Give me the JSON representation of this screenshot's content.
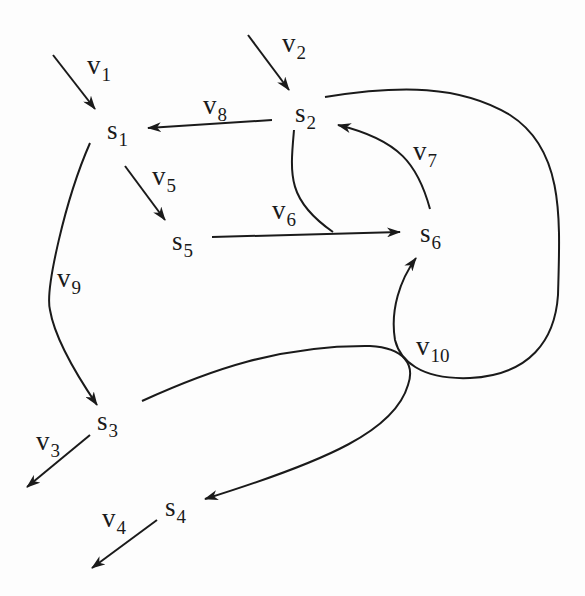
{
  "diagram": {
    "type": "directed-graph",
    "nodes": [
      {
        "id": "s1",
        "text": "s",
        "sub": "1"
      },
      {
        "id": "s2",
        "text": "s",
        "sub": "2"
      },
      {
        "id": "s3",
        "text": "s",
        "sub": "3"
      },
      {
        "id": "s4",
        "text": "s",
        "sub": "4"
      },
      {
        "id": "s5",
        "text": "s",
        "sub": "5"
      },
      {
        "id": "s6",
        "text": "s",
        "sub": "6"
      }
    ],
    "edges": [
      {
        "id": "v1",
        "text": "v",
        "sub": "1",
        "from": "input",
        "to": "s1"
      },
      {
        "id": "v2",
        "text": "v",
        "sub": "2",
        "from": "input",
        "to": "s2"
      },
      {
        "id": "v3",
        "text": "v",
        "sub": "3",
        "from": "s3",
        "to": "output"
      },
      {
        "id": "v4",
        "text": "v",
        "sub": "4",
        "from": "s4",
        "to": "output"
      },
      {
        "id": "v5",
        "text": "v",
        "sub": "5",
        "from": "s1",
        "to": "s5"
      },
      {
        "id": "v6",
        "text": "v",
        "sub": "6",
        "from": "s5+s2",
        "to": "s6"
      },
      {
        "id": "v7",
        "text": "v",
        "sub": "7",
        "from": "s6",
        "to": "s2"
      },
      {
        "id": "v8",
        "text": "v",
        "sub": "8",
        "from": "s2",
        "to": "s1"
      },
      {
        "id": "v9",
        "text": "v",
        "sub": "9",
        "from": "s1",
        "to": "s3"
      },
      {
        "id": "v10",
        "text": "v",
        "sub": "10",
        "from": "s2+s3",
        "to": "s6+s4"
      }
    ],
    "colors": {
      "line": "#1a1a1a",
      "background": "#fdfdfd"
    }
  }
}
